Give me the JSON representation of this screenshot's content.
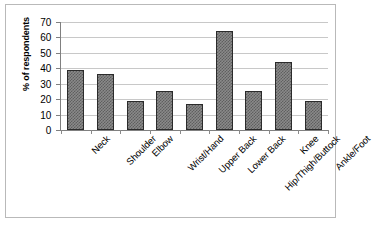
{
  "chart_data": {
    "type": "bar",
    "title": "",
    "xlabel": "",
    "ylabel": "% of respondents",
    "ylim": [
      0,
      70
    ],
    "ytick_step": 10,
    "yticks": [
      70,
      60,
      50,
      40,
      30,
      20,
      10,
      0
    ],
    "grid": true,
    "legend": "none",
    "categories": [
      "Neck",
      "Shoulder",
      "Elbow",
      "Wrist/Hand",
      "Upper Back",
      "Lower Back",
      "Hip/Thigh/Buttock",
      "Knee",
      "Ankle/Foot"
    ],
    "values": [
      39,
      36,
      19,
      25,
      17,
      64,
      25,
      44,
      19
    ],
    "bar_fill": "#8a8a8a",
    "bar_pattern": "checkered",
    "bar_border": "#2b2b2b",
    "gridline_color": "#c8c8c8",
    "axis_color": "#808080",
    "frame_color": "#b9b9b9",
    "background": "#ffffff"
  }
}
